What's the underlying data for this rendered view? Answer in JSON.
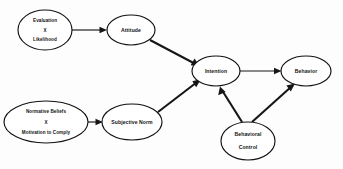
{
  "diagram": {
    "background_color": "#fdfdfd",
    "stroke_color": "#161616",
    "node_fill": "#ffffff",
    "nodes": {
      "evaluation_likelihood": {
        "id": "evaluation-likelihood",
        "lines": [
          "Evaluation",
          "X",
          "Likelihood"
        ],
        "line1": "Evaluation",
        "line2": "X",
        "line3": "Likelihood",
        "cx": 45,
        "cy": 30,
        "rx": 27,
        "ry": 20
      },
      "attitude": {
        "id": "attitude",
        "label": "Attitude",
        "cx": 131,
        "cy": 30,
        "rx": 24,
        "ry": 15
      },
      "normative_beliefs": {
        "id": "normative-beliefs",
        "lines": [
          "Normative Beliefs",
          "X",
          "Motivation to Comply"
        ],
        "line1": "Normative Beliefs",
        "line2": "X",
        "line3": "Motivation to Comply",
        "cx": 46,
        "cy": 122,
        "rx": 42,
        "ry": 21
      },
      "subjective_norm": {
        "id": "subjective-norm",
        "label": "Subjective Norm",
        "cx": 132,
        "cy": 122,
        "rx": 30,
        "ry": 18
      },
      "intention": {
        "id": "intention",
        "label": "Intention",
        "cx": 216,
        "cy": 71,
        "rx": 24,
        "ry": 15
      },
      "behavior": {
        "id": "behavior",
        "label": "Behavior",
        "cx": 306,
        "cy": 71,
        "rx": 25,
        "ry": 15
      },
      "behavioral_control": {
        "id": "behavioral-control",
        "lines": [
          "Behavioral",
          "Control"
        ],
        "line1": "Behavioral",
        "line2": "Control",
        "cx": 248,
        "cy": 141,
        "rx": 27,
        "ry": 19
      }
    },
    "edges": [
      {
        "id": "evaluation-to-attitude",
        "from": "evaluation_likelihood",
        "to": "attitude",
        "weight": "thin"
      },
      {
        "id": "attitude-to-intention",
        "from": "attitude",
        "to": "intention",
        "weight": "thick"
      },
      {
        "id": "normative-to-subjective",
        "from": "normative_beliefs",
        "to": "subjective_norm",
        "weight": "thin"
      },
      {
        "id": "subjective-to-intention",
        "from": "subjective_norm",
        "to": "intention",
        "weight": "thick"
      },
      {
        "id": "intention-to-behavior",
        "from": "intention",
        "to": "behavior",
        "weight": "thin"
      },
      {
        "id": "control-to-intention",
        "from": "behavioral_control",
        "to": "intention",
        "weight": "thick"
      },
      {
        "id": "control-to-behavior",
        "from": "behavioral_control",
        "to": "behavior",
        "weight": "thick"
      }
    ]
  }
}
